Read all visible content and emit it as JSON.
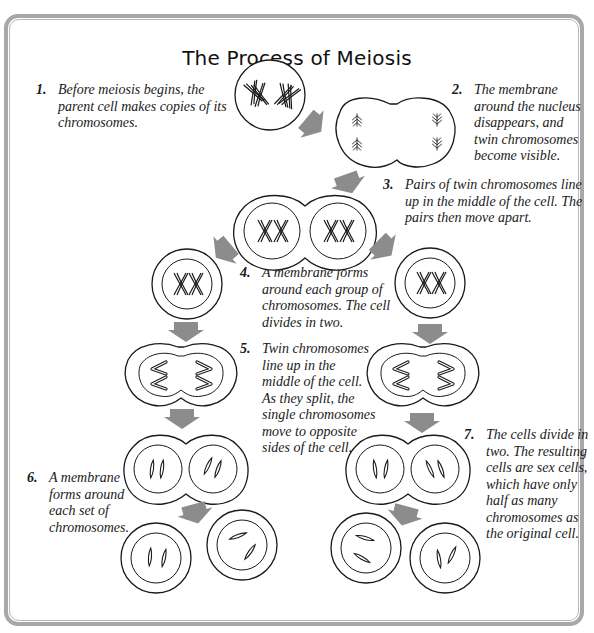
{
  "title": "The Process of Meiosis",
  "steps": [
    {
      "number": "1.",
      "text": "Before meiosis begins, the parent cell makes copies of its chromosomes."
    },
    {
      "number": "2.",
      "text": "The membrane around the nucleus disappears, and twin chromosomes become visible."
    },
    {
      "number": "3.",
      "text": "Pairs of twin chromosomes line up in the middle of the cell.  The pairs then move apart."
    },
    {
      "number": "4.",
      "text": "A membrane forms around each group of chromosomes.  The cell divides in two."
    },
    {
      "number": "5.",
      "text": "Twin chromosomes line up in the middle of the cell.  As they split, the single chromosomes move to opposite sides of the cell."
    },
    {
      "number": "6.",
      "text": "A membrane forms around each set of chromosomes."
    },
    {
      "number": "7.",
      "text": "The cells divide in two.  The resulting cells are sex cells, which have only half as many chromosomes as the original cell."
    }
  ],
  "colors": {
    "arrow": "#8c8c8c",
    "outline": "#1a1a1a",
    "frame": "#a8a8a8"
  }
}
